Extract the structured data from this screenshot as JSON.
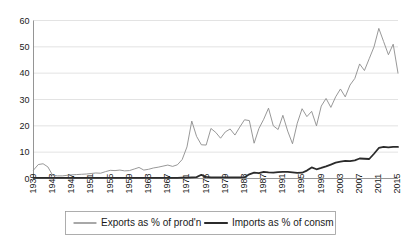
{
  "chart_data": {
    "type": "line",
    "title": "",
    "xlabel": "",
    "ylabel": "",
    "ylim": [
      0,
      60
    ],
    "yticks": [
      0,
      10,
      20,
      30,
      40,
      50,
      60
    ],
    "xlim": [
      1939,
      2015
    ],
    "xticks": [
      1939,
      1943,
      1947,
      1951,
      1955,
      1959,
      1963,
      1967,
      1971,
      1975,
      1979,
      1983,
      1987,
      1991,
      1995,
      1999,
      2003,
      2007,
      2011,
      2015
    ],
    "grid": true,
    "legend_position": "bottom",
    "x": [
      1939,
      1940,
      1941,
      1942,
      1943,
      1944,
      1945,
      1946,
      1947,
      1948,
      1949,
      1950,
      1951,
      1952,
      1953,
      1954,
      1955,
      1956,
      1957,
      1958,
      1959,
      1960,
      1961,
      1962,
      1963,
      1964,
      1965,
      1966,
      1967,
      1968,
      1969,
      1970,
      1971,
      1972,
      1973,
      1974,
      1975,
      1976,
      1977,
      1978,
      1979,
      1980,
      1981,
      1982,
      1983,
      1984,
      1985,
      1986,
      1987,
      1988,
      1989,
      1990,
      1991,
      1992,
      1993,
      1994,
      1995,
      1996,
      1997,
      1998,
      1999,
      2000,
      2001,
      2002,
      2003,
      2004,
      2005,
      2006,
      2007,
      2008,
      2009,
      2010,
      2011,
      2012,
      2013,
      2014,
      2015
    ],
    "series": [
      {
        "name": "Exports as % of prod'n",
        "color": "#8c8c8c",
        "width": 0.9,
        "values": [
          3.2,
          5.3,
          5.6,
          4.4,
          1.2,
          1.0,
          1.0,
          1.2,
          1.4,
          1.5,
          1.6,
          1.7,
          1.9,
          2.1,
          2.0,
          2.6,
          3.1,
          3.0,
          3.2,
          2.9,
          3.0,
          3.6,
          4.2,
          3.2,
          3.5,
          4.0,
          4.3,
          4.7,
          5.1,
          4.6,
          5.2,
          7.2,
          12.0,
          21.8,
          16.0,
          12.8,
          12.7,
          19.0,
          17.5,
          15.3,
          17.7,
          18.8,
          16.5,
          19.5,
          22.3,
          22.0,
          13.4,
          19.0,
          22.5,
          26.7,
          20.0,
          18.6,
          24.0,
          18.0,
          13.2,
          21.0,
          26.5,
          23.5,
          25.5,
          20.0,
          27.5,
          30.4,
          27.0,
          31.0,
          34.0,
          31.0,
          35.5,
          38.0,
          43.5,
          41.0,
          45.5,
          50.0,
          57.0,
          52.0,
          47.0,
          51.0,
          40.0
        ]
      },
      {
        "name": "Imports as % of consm",
        "color": "#2b2b2b",
        "width": 1.8,
        "values": [
          0.2,
          0.2,
          0.2,
          0.2,
          0.2,
          0.2,
          0.2,
          0.2,
          0.2,
          0.2,
          0.2,
          0.2,
          0.2,
          0.2,
          0.2,
          0.2,
          0.2,
          0.2,
          0.2,
          0.2,
          0.2,
          0.2,
          0.2,
          0.2,
          0.2,
          0.2,
          0.2,
          0.2,
          0.2,
          0.2,
          0.2,
          0.3,
          0.3,
          0.4,
          0.5,
          1.4,
          0.6,
          0.4,
          0.4,
          0.4,
          0.4,
          0.4,
          0.4,
          0.4,
          0.5,
          1.6,
          2.2,
          2.0,
          2.5,
          2.3,
          2.2,
          2.4,
          2.5,
          2.5,
          2.3,
          2.1,
          2.2,
          3.0,
          4.2,
          3.5,
          4.0,
          4.6,
          5.3,
          6.0,
          6.4,
          6.7,
          6.6,
          6.9,
          7.6,
          7.5,
          7.4,
          9.4,
          11.6,
          12.0,
          11.8,
          12.0,
          12.0
        ]
      }
    ]
  },
  "legend": {
    "entries": [
      {
        "label": "Exports as % of prod'n"
      },
      {
        "label": "Imports as % of consm"
      }
    ]
  },
  "axis": {
    "y_labels": [
      "0",
      "10",
      "20",
      "30",
      "40",
      "50",
      "60"
    ],
    "x_labels": [
      "1939",
      "1943",
      "1947",
      "1951",
      "1955",
      "1959",
      "1963",
      "1967",
      "1971",
      "1975",
      "1979",
      "1983",
      "1987",
      "1991",
      "1995",
      "1999",
      "2003",
      "2007",
      "2011",
      "2015"
    ]
  }
}
